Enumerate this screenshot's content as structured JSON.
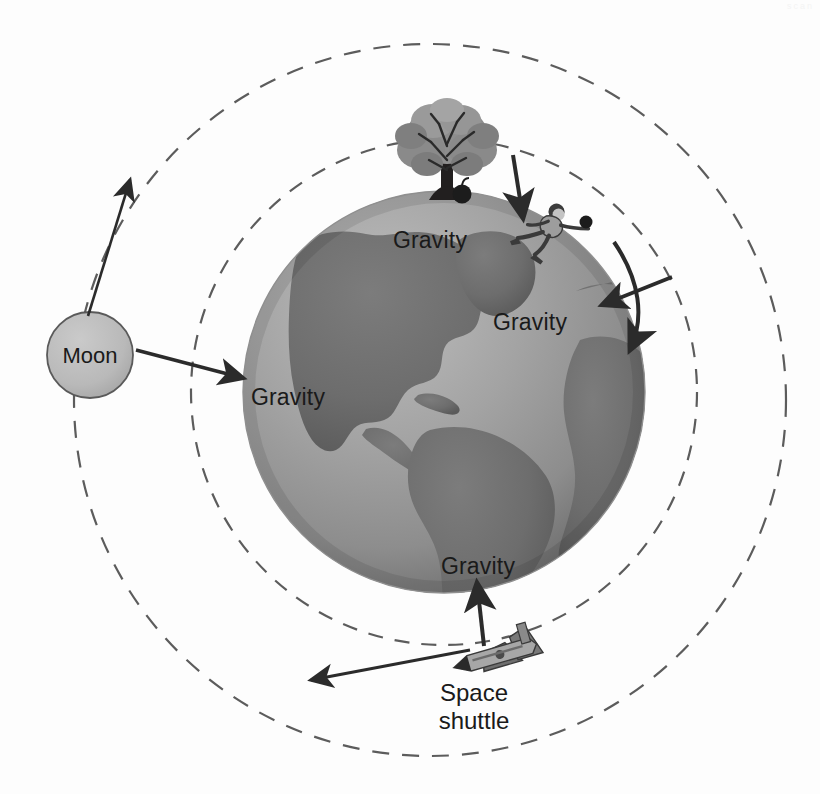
{
  "figure": {
    "type": "science-diagram",
    "background_color": "#fdfdfd",
    "width": 820,
    "height": 794
  },
  "earth": {
    "name": "Earth",
    "center": {
      "x": 444,
      "y": 392
    },
    "radius": 201,
    "ocean_color": "#9a9a9a",
    "land_color": "#6f6f6f",
    "highlight_color": "#b6b6b6",
    "shadow_color": "#7d7d7d"
  },
  "moon": {
    "label": "Moon",
    "center": {
      "x": 90,
      "y": 355
    },
    "radius": 43,
    "fill_color": "#bcbcbc",
    "stroke_color": "#5a5a5a"
  },
  "orbits": [
    {
      "name": "shuttle-orbit",
      "center": {
        "x": 444,
        "y": 392
      },
      "radius": 253,
      "style": "dashed",
      "color": "#5c5c5c"
    },
    {
      "name": "moon-orbit",
      "center": {
        "x": 430,
        "y": 400
      },
      "radius": 356,
      "style": "dashed",
      "color": "#5c5c5c"
    }
  ],
  "gravity_labels": [
    {
      "id": "gravity-tree",
      "text": "Gravity",
      "x": 430,
      "y": 240
    },
    {
      "id": "gravity-thrower",
      "text": "Gravity",
      "x": 530,
      "y": 322
    },
    {
      "id": "gravity-moon",
      "text": "Gravity",
      "x": 247,
      "y": 397
    },
    {
      "id": "gravity-shuttle",
      "text": "Gravity",
      "x": 437,
      "y": 567
    }
  ],
  "objects": {
    "tree": {
      "name": "apple-tree",
      "x": 447,
      "y": 170
    },
    "apple": {
      "name": "falling-apple",
      "x": 462,
      "y": 194,
      "fill_color": "#1c1c1c"
    },
    "thrower": {
      "name": "person-throwing-ball",
      "x": 556,
      "y": 214
    },
    "ball": {
      "name": "thrown-ball",
      "x": 584,
      "y": 222,
      "fill_color": "#1c1c1c"
    },
    "shuttle": {
      "name": "space-shuttle",
      "x": 500,
      "y": 655
    }
  },
  "captions": {
    "shuttle_line1": "Space",
    "shuttle_line2": "shuttle",
    "shuttle_x": 474,
    "shuttle_line1_y": 695,
    "shuttle_line2_y": 723
  },
  "arrows": {
    "apple_gravity": {
      "name": "apple-gravity-arrow",
      "direction": "down",
      "from": {
        "x": 516,
        "y": 158
      },
      "to": {
        "x": 524,
        "y": 222
      }
    },
    "moon_gravity": {
      "name": "moon-gravity-arrow",
      "direction": "right",
      "from": {
        "x": 136,
        "y": 351
      },
      "to": {
        "x": 245,
        "y": 378
      }
    },
    "moon_velocity": {
      "name": "moon-velocity-arrow",
      "direction": "up-right",
      "from": {
        "x": 92,
        "y": 312
      },
      "to": {
        "x": 130,
        "y": 176
      }
    },
    "ball_gravity": {
      "name": "ball-gravity-arrow",
      "direction": "down-left",
      "from": {
        "x": 665,
        "y": 280
      },
      "to": {
        "x": 603,
        "y": 306
      }
    },
    "ball_trajectory": {
      "name": "ball-trajectory-arrow",
      "direction": "curve-down",
      "from": {
        "x": 617,
        "y": 245
      },
      "to": {
        "x": 620,
        "y": 345
      }
    },
    "shuttle_gravity": {
      "name": "shuttle-gravity-arrow",
      "direction": "up",
      "from": {
        "x": 481,
        "y": 645
      },
      "to": {
        "x": 478,
        "y": 585
      }
    },
    "shuttle_velocity": {
      "name": "shuttle-velocity-arrow",
      "direction": "left",
      "from": {
        "x": 462,
        "y": 652
      },
      "to": {
        "x": 310,
        "y": 681
      }
    }
  },
  "colors": {
    "line": "#2b2b2b",
    "dash": "#5c5c5c",
    "text": "#1a1a1a",
    "tree_foliage": "#8c8c8c",
    "tree_foliage_dark": "#6a6a6a",
    "tree_trunk": "#2a2a2a",
    "shuttle_body": "#9c9c9c",
    "shuttle_dark": "#5f5f5f",
    "person_skin": "#c9c9c9",
    "person_cloth": "#6e6e6e"
  },
  "artifact": {
    "corner_text": "scan"
  }
}
